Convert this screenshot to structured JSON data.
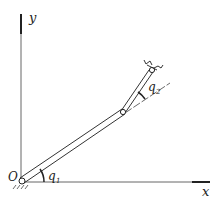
{
  "diagram": {
    "type": "two-link planar manipulator",
    "axes": {
      "x_label": "x",
      "y_label": "y",
      "origin_label": "O"
    },
    "joint_angles": {
      "q1_label": "q",
      "q1_sub": "1",
      "q2_label": "q",
      "q2_sub": "2"
    },
    "colors": {
      "line": "#333333",
      "axis": "#555555"
    }
  }
}
